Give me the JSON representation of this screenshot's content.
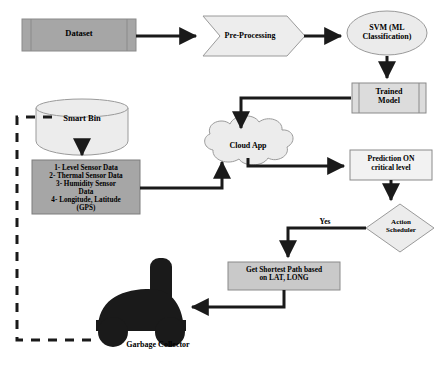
{
  "diagram": {
    "colors": {
      "process_fill": "#a6a6a6",
      "light_fill": "#e8e8e8",
      "stroke": "#808080",
      "line": "#1a1a1a",
      "truck": "#1a1a1a",
      "background": "#ffffff"
    },
    "nodes": [
      {
        "id": "dataset",
        "label": "Dataset",
        "shape": "predefined-process",
        "fill": "#a6a6a6"
      },
      {
        "id": "preprocessing",
        "label": "Pre-Processing",
        "shape": "chevron",
        "fill": "#ededed"
      },
      {
        "id": "svm",
        "label": "SVM (ML\nClassification)",
        "shape": "ellipse",
        "fill": "#ebebeb"
      },
      {
        "id": "trained",
        "label": "Trained\nModel",
        "shape": "predefined-process",
        "fill": "#dcdcdc"
      },
      {
        "id": "smartbin",
        "label": "Smart Bin",
        "shape": "cylinder",
        "fill": "#ececec"
      },
      {
        "id": "sensors",
        "label": "1- Level Sensor Data\n2- Thermal Sensor Data\n3- Humidity Sensor\nData\n4- Longitude, Latitude\n(GPS)",
        "shape": "rectangle",
        "fill": "#a6a6a6"
      },
      {
        "id": "cloud",
        "label": "Cloud App",
        "shape": "cloud",
        "fill": "#ececec"
      },
      {
        "id": "prediction",
        "label": "Prediction ON\ncritical level",
        "shape": "rectangle",
        "fill": "#f2f2f2"
      },
      {
        "id": "action",
        "label": "Action\nScheduler",
        "shape": "diamond",
        "fill": "#ececec"
      },
      {
        "id": "shortestpath",
        "label": "Get Shortest Path based\non LAT, LONG",
        "shape": "rectangle",
        "fill": "#c9c9c9"
      },
      {
        "id": "truck",
        "label": "Garbage Collector",
        "shape": "truck-silhouette",
        "fill": "#1a1a1a"
      }
    ],
    "edges": [
      {
        "from": "dataset",
        "to": "preprocessing",
        "label": "",
        "style": "solid"
      },
      {
        "from": "preprocessing",
        "to": "svm",
        "label": "",
        "style": "solid"
      },
      {
        "from": "svm",
        "to": "trained",
        "label": "",
        "style": "solid"
      },
      {
        "from": "trained",
        "to": "cloud",
        "label": "",
        "style": "solid"
      },
      {
        "from": "smartbin",
        "to": "sensors",
        "label": "",
        "style": "solid"
      },
      {
        "from": "sensors",
        "to": "cloud",
        "label": "",
        "style": "solid"
      },
      {
        "from": "cloud",
        "to": "prediction",
        "label": "",
        "style": "solid"
      },
      {
        "from": "prediction",
        "to": "action",
        "label": "",
        "style": "solid"
      },
      {
        "from": "action",
        "to": "shortestpath",
        "label": "Yes",
        "style": "solid"
      },
      {
        "from": "shortestpath",
        "to": "truck",
        "label": "",
        "style": "solid"
      },
      {
        "from": "truck",
        "to": "smartbin",
        "label": "",
        "style": "dashed"
      }
    ],
    "edge_labels": {
      "yes": "Yes"
    }
  }
}
